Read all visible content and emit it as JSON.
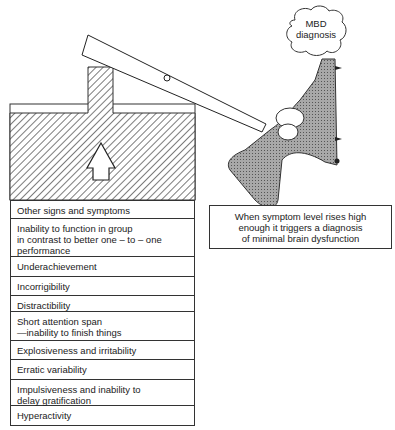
{
  "diagram": {
    "type": "trigger-mechanism illustration",
    "cloud": {
      "line1": "MBD",
      "line2": "diagnosis"
    },
    "caption": {
      "line1": "When symptom level rises high",
      "line2": "enough it triggers a diagnosis",
      "line3": "of minimal brain dysfunction"
    },
    "symptoms": [
      {
        "lines": [
          "Other signs and symptoms"
        ]
      },
      {
        "lines": [
          "Inability to function in group",
          "in contrast to better one – to – one",
          "performance"
        ]
      },
      {
        "lines": [
          "Underachievement"
        ]
      },
      {
        "lines": [
          "Incorrigibility"
        ]
      },
      {
        "lines": [
          "Distractibility"
        ]
      },
      {
        "lines": [
          "Short attention span",
          "—inability to finish things"
        ]
      },
      {
        "lines": [
          "Explosiveness and irritability"
        ]
      },
      {
        "lines": [
          "Erratic variability"
        ]
      },
      {
        "lines": [
          "Impulsiveness and inability to",
          "delay gratification"
        ]
      },
      {
        "lines": [
          "Hyperactivity"
        ]
      }
    ],
    "colors": {
      "ink": "#222222",
      "gun_fill": "#9a9a9a",
      "hatch": "#444444"
    }
  }
}
